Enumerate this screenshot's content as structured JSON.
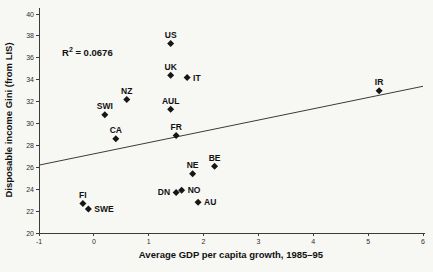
{
  "chart_data": {
    "type": "scatter",
    "title": "",
    "xlabel": "Average GDP per capita growth, 1985–95",
    "ylabel": "Disposable income Gini (from LIS)",
    "xlim": [
      -1,
      6
    ],
    "ylim": [
      20,
      40
    ],
    "x_ticks": [
      -1,
      0,
      1,
      2,
      3,
      4,
      5,
      6
    ],
    "y_ticks": [
      20,
      22,
      24,
      26,
      28,
      30,
      32,
      34,
      36,
      38,
      40
    ],
    "grid": false,
    "legend": "none",
    "annotation": {
      "base": "R",
      "sup": "2",
      "rest": " = 0.0676"
    },
    "trendline": {
      "x1": -1,
      "y1": 26.2,
      "x2": 6,
      "y2": 33.4
    },
    "marker_color": "#161616",
    "axis_color": "#3b3b3b",
    "points": [
      {
        "label": "US",
        "x": 1.4,
        "y": 37.3,
        "label_pos": "above"
      },
      {
        "label": "UK",
        "x": 1.4,
        "y": 34.4,
        "label_pos": "above"
      },
      {
        "label": "IT",
        "x": 1.7,
        "y": 34.2,
        "label_pos": "right"
      },
      {
        "label": "IR",
        "x": 5.2,
        "y": 33.0,
        "label_pos": "above"
      },
      {
        "label": "NZ",
        "x": 0.6,
        "y": 32.2,
        "label_pos": "above"
      },
      {
        "label": "AUL",
        "x": 1.4,
        "y": 31.3,
        "label_pos": "above"
      },
      {
        "label": "SWI",
        "x": 0.2,
        "y": 30.8,
        "label_pos": "above"
      },
      {
        "label": "FR",
        "x": 1.5,
        "y": 28.9,
        "label_pos": "above"
      },
      {
        "label": "CA",
        "x": 0.4,
        "y": 28.6,
        "label_pos": "above"
      },
      {
        "label": "BE",
        "x": 2.2,
        "y": 26.1,
        "label_pos": "above"
      },
      {
        "label": "NE",
        "x": 1.8,
        "y": 25.4,
        "label_pos": "above"
      },
      {
        "label": "NO",
        "x": 1.6,
        "y": 23.9,
        "label_pos": "right"
      },
      {
        "label": "DN",
        "x": 1.5,
        "y": 23.7,
        "label_pos": "left"
      },
      {
        "label": "AU",
        "x": 1.9,
        "y": 22.8,
        "label_pos": "right"
      },
      {
        "label": "FI",
        "x": -0.2,
        "y": 22.7,
        "label_pos": "above"
      },
      {
        "label": "SWE",
        "x": -0.1,
        "y": 22.2,
        "label_pos": "right"
      }
    ]
  }
}
